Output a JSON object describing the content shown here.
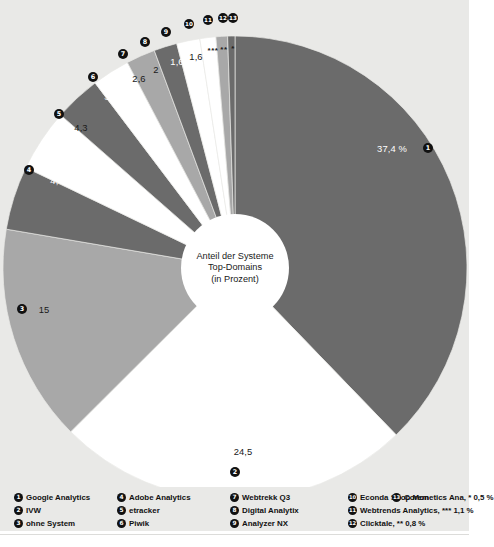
{
  "background_color": "#e9e9e7",
  "center": {
    "line1": "Anteil der Systeme",
    "line2": "Top-Domains",
    "line3": "(in Prozent)"
  },
  "chart_data": {
    "type": "pie",
    "title": "Anteil der Systeme Top-Domains (in Prozent)",
    "unit": "%",
    "legend_position": "bottom",
    "grid": false,
    "colors": {
      "dark": "#6b6b6b",
      "white": "#ffffff",
      "medium": "#a8a8a8"
    },
    "start_angle_deg": 0,
    "direction": "clockwise",
    "categories": [
      "Google Analytics",
      "IVW",
      "ohne System",
      "Adobe Analytics",
      "etracker",
      "Piwik",
      "Webtrekk Q3",
      "Digital Analytix",
      "Analyzer NX",
      "Econda Shop Mon",
      "Webtrends Analytics",
      "Clicktale",
      "Coremetics Ana"
    ],
    "values": [
      37.4,
      24.5,
      15,
      4.4,
      4.3,
      3.2,
      2.6,
      2,
      1.6,
      1.6,
      1.1,
      0.8,
      0.5
    ],
    "slices": [
      {
        "n": "1",
        "label": "Google Analytics",
        "value": 37.4,
        "display": "37,4 %",
        "color": "#6b6b6b",
        "text_color": "#ffffff"
      },
      {
        "n": "2",
        "label": "IVW",
        "value": 24.5,
        "display": "24,5",
        "color": "#ffffff",
        "text_color": "#1a1a1a"
      },
      {
        "n": "3",
        "label": "ohne System",
        "value": 15,
        "display": "15",
        "color": "#a8a8a8",
        "text_color": "#1a1a1a"
      },
      {
        "n": "4",
        "label": "Adobe Analytics",
        "value": 4.4,
        "display": "4,4",
        "color": "#6b6b6b",
        "text_color": "#ffffff"
      },
      {
        "n": "5",
        "label": "etracker",
        "value": 4.3,
        "display": "4,3",
        "color": "#ffffff",
        "text_color": "#1a1a1a"
      },
      {
        "n": "6",
        "label": "Piwik",
        "value": 3.2,
        "display": "3,2",
        "color": "#6b6b6b",
        "text_color": "#ffffff"
      },
      {
        "n": "7",
        "label": "Webtrekk Q3",
        "value": 2.6,
        "display": "2,6",
        "color": "#ffffff",
        "text_color": "#1a1a1a"
      },
      {
        "n": "8",
        "label": "Digital Analytix",
        "value": 2,
        "display": "2",
        "color": "#a8a8a8",
        "text_color": "#1a1a1a"
      },
      {
        "n": "9",
        "label": "Analyzer NX",
        "value": 1.6,
        "display": "1,6",
        "color": "#6b6b6b",
        "text_color": "#ffffff"
      },
      {
        "n": "10",
        "label": "Econda Shop Mon",
        "value": 1.6,
        "display": "1,6",
        "color": "#ffffff",
        "text_color": "#1a1a1a"
      },
      {
        "n": "11",
        "label": "Webtrends Analytics",
        "value": 1.1,
        "display": "***",
        "color": "#ffffff",
        "text_color": "#1a1a1a"
      },
      {
        "n": "12",
        "label": "Clicktale",
        "value": 0.8,
        "display": "**",
        "color": "#a8a8a8",
        "text_color": "#1a1a1a"
      },
      {
        "n": "13",
        "label": "Coremetics Ana",
        "value": 0.5,
        "display": "*",
        "color": "#6b6b6b",
        "text_color": "#1a1a1a"
      }
    ]
  },
  "labels": {
    "v1": "37,4 %",
    "v2": "24,5",
    "v3": "15",
    "v4": "4,4",
    "v5": "4,3",
    "v6": "3,2",
    "v7": "2,6",
    "v8": "2",
    "v9": "1,6",
    "v10": "1,6",
    "v11": "***",
    "v12": "**",
    "v13": "*"
  },
  "bullets": {
    "b1": "1",
    "b2": "2",
    "b3": "3",
    "b4": "4",
    "b5": "5",
    "b6": "6",
    "b7": "7",
    "b8": "8",
    "b9": "9",
    "b10": "10",
    "b11": "11",
    "b12": "12",
    "b13": "13"
  },
  "legend": {
    "columns": [
      {
        "items": [
          {
            "n": "1",
            "text": "Google Analytics"
          },
          {
            "n": "2",
            "text": "IVW"
          },
          {
            "n": "3",
            "text": "ohne System"
          }
        ]
      },
      {
        "items": [
          {
            "n": "4",
            "text": "Adobe Analytics"
          },
          {
            "n": "5",
            "text": "etracker"
          },
          {
            "n": "6",
            "text": "Piwik"
          }
        ]
      },
      {
        "items": [
          {
            "n": "7",
            "text": "Webtrekk Q3"
          },
          {
            "n": "8",
            "text": "Digital Analytix"
          },
          {
            "n": "9",
            "text": "Analyzer NX"
          }
        ]
      },
      {
        "items": [
          {
            "n": "10",
            "text": "Econda Shop Mon"
          },
          {
            "n": "11",
            "text": "Webtrends Analytics, *** 1,1 %"
          },
          {
            "n": "12",
            "text": "Clicktale, ** 0,8 %"
          }
        ]
      },
      {
        "items": [
          {
            "n": "13",
            "text": "Coremetics Ana, * 0,5 %"
          }
        ]
      }
    ]
  }
}
